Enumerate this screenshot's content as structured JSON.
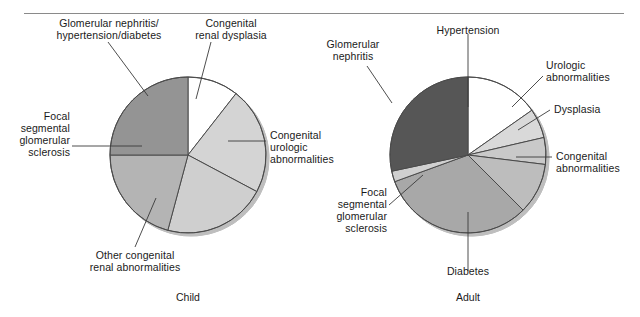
{
  "figure": {
    "divider": "horizontal-rule"
  },
  "charts": [
    {
      "id": "child",
      "caption": "Child",
      "center": [
        188,
        155
      ],
      "radius": 78,
      "labels": [
        {
          "key": "gn_htn_dm",
          "text": "Glomerular nephritis/\nhypertension/diabetes"
        },
        {
          "key": "cong_renal_dysplasia",
          "text": "Congenital\nrenal dysplasia"
        },
        {
          "key": "fsgs",
          "text": "Focal\nsegmental\nglomerular\nsclerosis"
        },
        {
          "key": "cong_urologic",
          "text": "Congenital\nurologic\nabnormalities"
        },
        {
          "key": "other_cong_renal",
          "text": "Other congenital\nrenal abnormalities"
        }
      ],
      "chart_data": {
        "type": "pie",
        "title": "Child",
        "categories": [
          "Congenital renal dysplasia",
          "Congenital urologic abnormalities",
          "Other congenital renal abnormalities",
          "Focal segmental glomerular sclerosis",
          "Glomerular nephritis/hypertension/diabetes"
        ],
        "values": [
          10.6,
          22.2,
          21.4,
          20.8,
          25.0
        ],
        "unit": "percent",
        "angles_deg": [
          38,
          80,
          77,
          75,
          90
        ],
        "colors": [
          "#ffffff",
          "#d4d4d4",
          "#cfcfcf",
          "#b4b4b4",
          "#949494"
        ],
        "legend": "none",
        "grid": false
      }
    },
    {
      "id": "adult",
      "caption": "Adult",
      "center": [
        468,
        155
      ],
      "radius": 78,
      "labels": [
        {
          "key": "hypertension",
          "text": "Hypertension"
        },
        {
          "key": "glomerular_nephritis",
          "text": "Glomerular\nnephritis"
        },
        {
          "key": "urologic",
          "text": "Urologic\nabnormalities"
        },
        {
          "key": "dysplasia",
          "text": "Dysplasia"
        },
        {
          "key": "congenital",
          "text": "Congenital\nabnormalities"
        },
        {
          "key": "fsgs",
          "text": "Focal\nsegmental\nglomerular\nsclerosis"
        },
        {
          "key": "diabetes",
          "text": "Diabetes"
        }
      ],
      "chart_data": {
        "type": "pie",
        "title": "Adult",
        "categories": [
          "Hypertension",
          "Urologic abnormalities",
          "Dysplasia",
          "Congenital abnormalities",
          "Diabetes",
          "Focal segmental glomerular sclerosis",
          "Glomerular nephritis"
        ],
        "values": [
          15.3,
          6.1,
          5.6,
          10.6,
          31.9,
          2.2,
          28.3
        ],
        "unit": "percent",
        "angles_deg": [
          55,
          22,
          20,
          38,
          115,
          8,
          102
        ],
        "colors": [
          "#ffffff",
          "#d9d9d9",
          "#c9c9c9",
          "#bdbdbd",
          "#a8a8a8",
          "#d0d0d0",
          "#565656"
        ],
        "legend": "none",
        "grid": false
      }
    }
  ]
}
